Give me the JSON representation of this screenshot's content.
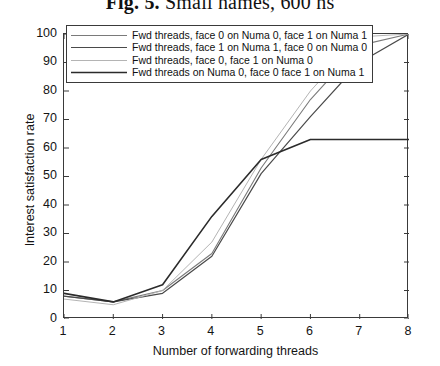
{
  "figure": {
    "caption_label": "Fig. 5.",
    "caption_text": "Small names, 600 ns"
  },
  "axes": {
    "xlabel": "Number of forwarding threads",
    "ylabel": "Interest satisfaction rate",
    "xticks": [
      "1",
      "2",
      "3",
      "4",
      "5",
      "6",
      "7",
      "8"
    ],
    "yticks": [
      "0",
      "10",
      "20",
      "30",
      "40",
      "50",
      "60",
      "70",
      "80",
      "90",
      "100"
    ]
  },
  "legend": {
    "items": [
      {
        "label": "Fwd threads, face 0 on Numa 0, face 1 on Numa 1",
        "color": "#7a7a7a",
        "width": 1.1
      },
      {
        "label": "Fwd threads, face 1 on Numa 1, face 0 on Numa 0",
        "color": "#4a4a4a",
        "width": 1.2
      },
      {
        "label": "Fwd threads, face 0, face 1 on Numa 0",
        "color": "#b4b4b4",
        "width": 1.0
      },
      {
        "label": "Fwd threads on Numa 0, face 0 face 1 on Numa 1",
        "color": "#2b2b2b",
        "width": 1.6
      }
    ]
  },
  "chart_data": {
    "type": "line",
    "title": "Fig. 5. Small names, 600 ns",
    "xlabel": "Number of forwarding threads",
    "ylabel": "Interest satisfaction rate",
    "x": [
      1,
      2,
      3,
      4,
      5,
      6,
      7,
      8
    ],
    "xlim": [
      1,
      8
    ],
    "ylim": [
      0,
      100
    ],
    "grid": false,
    "legend_position": "upper left",
    "series": [
      {
        "name": "Fwd threads, face 0 on Numa 0, face 1 on Numa 1",
        "color": "#7a7a7a",
        "width": 1.1,
        "values": [
          8,
          6,
          10,
          23,
          53,
          77,
          96,
          100
        ]
      },
      {
        "name": "Fwd threads, face 1 on Numa 1, face 0 on Numa 0",
        "color": "#4a4a4a",
        "width": 1.2,
        "values": [
          8,
          6,
          9,
          22,
          51,
          71,
          90,
          100
        ]
      },
      {
        "name": "Fwd threads, face 0, face 1 on Numa 0",
        "color": "#b4b4b4",
        "width": 1.0,
        "values": [
          7,
          5,
          10,
          27,
          56,
          80,
          99,
          100
        ]
      },
      {
        "name": "Fwd threads on Numa 0, face 0 face 1 on Numa 1",
        "color": "#2b2b2b",
        "width": 1.6,
        "values": [
          9,
          6,
          12,
          36,
          56,
          63,
          63,
          63
        ]
      }
    ]
  }
}
